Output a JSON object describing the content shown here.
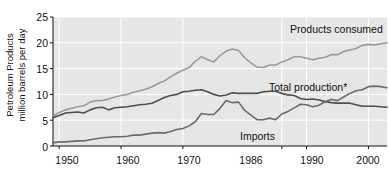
{
  "chart_data": {
    "type": "line",
    "title": "",
    "xlabel": "",
    "ylabel": "Petroleum Products million barrels per day",
    "ylabel_lines": [
      "Petroleum Products",
      "million barrels per day"
    ],
    "xlim": [
      1949,
      2003
    ],
    "ylim": [
      0,
      25
    ],
    "yticks": [
      0,
      5,
      10,
      15,
      20,
      25
    ],
    "ytick_labels": [
      "0",
      "5",
      "10",
      "15",
      "20",
      "25"
    ],
    "xticks": [
      1950,
      1960,
      1970,
      1986,
      1990,
      2000
    ],
    "xtick_labels": [
      "1950",
      "1960",
      "1970",
      "1986",
      "1990",
      "2000"
    ],
    "grid": true,
    "grid_color": "#ffffff",
    "plot_background": "#e6e6e6",
    "legend_position": "inline-annotations",
    "footnote_marker": "*",
    "series": [
      {
        "name": "Products consumed",
        "label": "Products consumed",
        "color": "#9a9a9a",
        "x": [
          1949,
          1950,
          1951,
          1952,
          1953,
          1954,
          1955,
          1956,
          1957,
          1958,
          1959,
          1960,
          1961,
          1962,
          1963,
          1964,
          1965,
          1966,
          1967,
          1968,
          1969,
          1970,
          1971,
          1972,
          1973,
          1974,
          1975,
          1976,
          1977,
          1978,
          1979,
          1980,
          1981,
          1982,
          1983,
          1984,
          1985,
          1986,
          1987,
          1988,
          1989,
          1990,
          1991,
          1992,
          1993,
          1994,
          1995,
          1996,
          1997,
          1998,
          1999,
          2000,
          2001,
          2002,
          2003
        ],
        "values": [
          5.8,
          6.5,
          7.0,
          7.3,
          7.6,
          7.8,
          8.5,
          8.8,
          8.8,
          9.1,
          9.5,
          9.8,
          10.0,
          10.4,
          10.7,
          11.0,
          11.5,
          12.1,
          12.6,
          13.4,
          14.1,
          14.7,
          15.2,
          16.4,
          17.3,
          16.7,
          16.3,
          17.5,
          18.4,
          18.8,
          18.5,
          17.1,
          16.1,
          15.3,
          15.2,
          15.7,
          15.7,
          16.3,
          16.7,
          17.3,
          17.3,
          17.0,
          16.7,
          17.0,
          17.2,
          17.7,
          17.7,
          18.3,
          18.6,
          18.9,
          19.5,
          19.7,
          19.6,
          19.8,
          20.0
        ]
      },
      {
        "name": "Total production",
        "label": "Total production*",
        "color": "#4d4d4d",
        "x": [
          1949,
          1950,
          1951,
          1952,
          1953,
          1954,
          1955,
          1956,
          1957,
          1958,
          1959,
          1960,
          1961,
          1962,
          1963,
          1964,
          1965,
          1966,
          1967,
          1968,
          1969,
          1970,
          1971,
          1972,
          1973,
          1974,
          1975,
          1976,
          1977,
          1978,
          1979,
          1980,
          1981,
          1982,
          1983,
          1984,
          1985,
          1986,
          1987,
          1988,
          1989,
          1990,
          1991,
          1992,
          1993,
          1994,
          1995,
          1996,
          1997,
          1998,
          1999,
          2000,
          2001,
          2002,
          2003
        ],
        "values": [
          5.5,
          5.9,
          6.4,
          6.5,
          6.6,
          6.4,
          7.0,
          7.4,
          7.5,
          7.0,
          7.4,
          7.5,
          7.6,
          7.8,
          8.0,
          8.1,
          8.3,
          8.8,
          9.4,
          9.8,
          10.0,
          10.5,
          10.6,
          10.8,
          10.9,
          10.5,
          10.0,
          9.7,
          9.9,
          10.3,
          10.2,
          10.2,
          10.2,
          10.2,
          10.5,
          10.6,
          10.6,
          10.2,
          9.9,
          9.8,
          9.2,
          9.0,
          9.1,
          8.9,
          8.6,
          8.4,
          8.3,
          8.3,
          8.3,
          8.0,
          7.7,
          7.7,
          7.7,
          7.6,
          7.5
        ]
      },
      {
        "name": "Imports",
        "label": "Imports",
        "color": "#6b6b6b",
        "x": [
          1949,
          1950,
          1951,
          1952,
          1953,
          1954,
          1955,
          1956,
          1957,
          1958,
          1959,
          1960,
          1961,
          1962,
          1963,
          1964,
          1965,
          1966,
          1967,
          1968,
          1969,
          1970,
          1971,
          1972,
          1973,
          1974,
          1975,
          1976,
          1977,
          1978,
          1979,
          1980,
          1981,
          1982,
          1983,
          1984,
          1985,
          1986,
          1987,
          1988,
          1989,
          1990,
          1991,
          1992,
          1993,
          1994,
          1995,
          1996,
          1997,
          1998,
          1999,
          2000,
          2001,
          2002,
          2003
        ],
        "values": [
          0.6,
          0.8,
          0.8,
          0.9,
          1.0,
          1.0,
          1.2,
          1.4,
          1.6,
          1.7,
          1.8,
          1.8,
          1.9,
          2.1,
          2.1,
          2.3,
          2.5,
          2.6,
          2.5,
          2.8,
          3.2,
          3.4,
          3.9,
          4.7,
          6.3,
          6.1,
          6.1,
          7.3,
          8.8,
          8.4,
          8.5,
          6.9,
          6.0,
          5.1,
          5.1,
          5.4,
          5.1,
          6.2,
          6.7,
          7.4,
          8.1,
          8.0,
          7.6,
          7.9,
          8.6,
          9.0,
          8.8,
          9.5,
          10.2,
          10.7,
          10.9,
          11.5,
          11.6,
          11.5,
          11.3
        ]
      }
    ]
  },
  "annotations": {
    "products_consumed": "Products consumed",
    "total_production": "Total production*",
    "imports": "Imports"
  }
}
